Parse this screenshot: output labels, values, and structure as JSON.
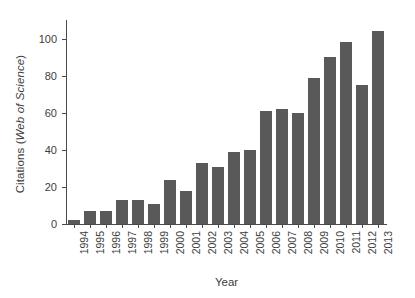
{
  "chart_data": {
    "type": "bar",
    "title": "",
    "xlabel": "Year",
    "ylabel": "Citations (Web of Science)",
    "ylabel_plain": "Citations (",
    "ylabel_italic": "Web of Science",
    "ylabel_close": ")",
    "categories": [
      "1994",
      "1995",
      "1996",
      "1997",
      "1998",
      "1999",
      "2000",
      "2001",
      "2002",
      "2003",
      "2004",
      "2005",
      "2006",
      "2007",
      "2008",
      "2009",
      "2010",
      "2011",
      "2012",
      "2013"
    ],
    "values": [
      2,
      7,
      7,
      13,
      13,
      11,
      24,
      18,
      33,
      31,
      39,
      40,
      61,
      62,
      60,
      79,
      90,
      98,
      75,
      104
    ],
    "ylim": [
      0,
      110
    ],
    "yticks": [
      0,
      20,
      40,
      60,
      80,
      100
    ],
    "ytick_labels": [
      "0",
      "20",
      "40",
      "60",
      "80",
      "100"
    ],
    "grid": false,
    "legend": null,
    "bar_color": "#595959",
    "axis_color": "#4a4a4a",
    "background": "#ffffff"
  }
}
